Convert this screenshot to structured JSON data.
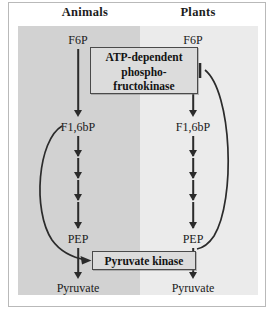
{
  "diagram": {
    "columns": [
      {
        "key": "animals",
        "label": "Animals"
      },
      {
        "key": "plants",
        "label": "Plants"
      }
    ],
    "pathway": {
      "animals": {
        "start": "F6P",
        "intermediate": "F1,6bP",
        "penultimate": "PEP",
        "end": "Pyruvate",
        "multi_step_arrow_count": 4
      },
      "plants": {
        "start": "F6P",
        "intermediate": "F1,6bP",
        "penultimate": "PEP",
        "end": "Pyruvate",
        "multi_step_arrow_count": 4
      }
    },
    "enzymes": {
      "pfk": {
        "line1": "ATP-dependent",
        "line2": "phospho-",
        "line3": "fructokinase"
      },
      "pyruvate_kinase": {
        "label": "Pyruvate kinase"
      }
    },
    "regulation": [
      {
        "side": "animals",
        "source": "F1,6bP",
        "target": "Pyruvate kinase",
        "type": "activation",
        "head": "arrowhead"
      },
      {
        "side": "plants",
        "source": "PEP",
        "target": "ATP-dependent phosphofructokinase",
        "type": "inhibition",
        "head": "t-bar"
      }
    ],
    "colors": {
      "panel_animals": "#d2d2d2",
      "panel_plants": "#ebebeb",
      "enzyme_box_fill": "#dcdcdc",
      "enzyme_box_border": "#4a4a4a",
      "arrow": "#2b2b2b",
      "text": "#1a1a1a",
      "frame": "#b9b9b9",
      "page_background": "#ffffff"
    }
  }
}
